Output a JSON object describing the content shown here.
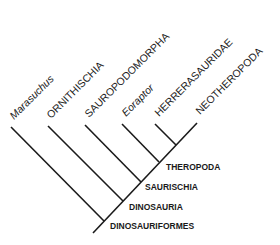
{
  "diagram": {
    "type": "cladogram",
    "colors": {
      "line": "#1a1a1a",
      "text": "#1a1a1a",
      "background": "#ffffff"
    },
    "taxa": [
      {
        "label": "Marasuchus",
        "italic": true
      },
      {
        "label": "ORNITHISCHIA",
        "italic": false
      },
      {
        "label": "SAUROPODOMORPHA",
        "italic": false
      },
      {
        "label": "Eoraptor",
        "italic": true
      },
      {
        "label": "HERRERASAURIDAE",
        "italic": false
      },
      {
        "label": "NEOTHEROPODA",
        "italic": false
      }
    ],
    "clades": [
      {
        "label": "THEROPODA"
      },
      {
        "label": "SAURISCHIA"
      },
      {
        "label": "DINOSAURIA"
      },
      {
        "label": "DINOSAURIFORMES"
      }
    ]
  }
}
